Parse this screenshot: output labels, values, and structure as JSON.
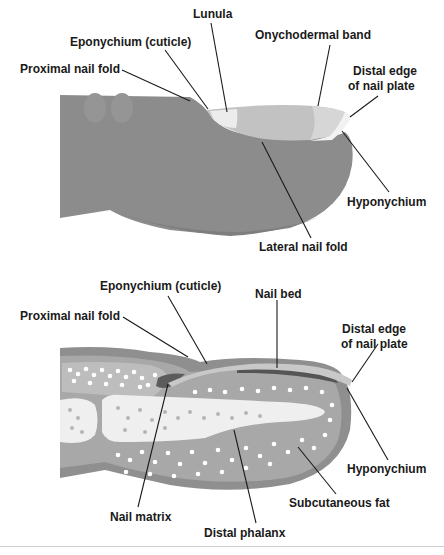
{
  "top_diagram": {
    "view": "external",
    "labels": {
      "lunula": "Lunula",
      "eponychium": "Eponychium (cuticle)",
      "onychodermal_band": "Onychodermal band",
      "proximal_nail_fold": "Proximal nail fold",
      "distal_edge_line1": "Distal edge",
      "distal_edge_line2": "of nail plate",
      "hyponychium": "Hyponychium",
      "lateral_nail_fold": "Lateral nail fold"
    }
  },
  "bottom_diagram": {
    "view": "cross-section",
    "labels": {
      "eponychium": "Eponychium (cuticle)",
      "nail_bed": "Nail bed",
      "proximal_nail_fold": "Proximal nail fold",
      "distal_edge_line1": "Distal edge",
      "distal_edge_line2": "of nail plate",
      "hyponychium": "Hyponychium",
      "subcutaneous_fat": "Subcutaneous fat",
      "nail_matrix": "Nail matrix",
      "distal_phalanx": "Distal phalanx"
    }
  },
  "colors": {
    "skin": "#8c8c8c",
    "skin_dark": "#6e6e6e",
    "nail_plate": "#c4c4c4",
    "lunula": "#ececec",
    "bone": "#efefef",
    "fat": "#ffffff",
    "leader_line": "#1a1a1a"
  }
}
